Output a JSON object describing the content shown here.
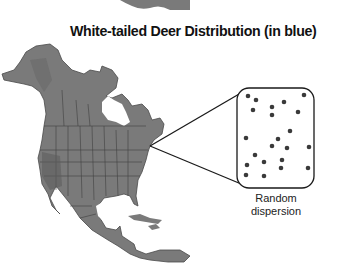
{
  "title": "White-tailed Deer Distribution (in blue)",
  "inset": {
    "label_line1": "Random",
    "label_line2": "dispersion",
    "dots": [
      [
        248,
        96
      ],
      [
        256,
        100
      ],
      [
        253,
        110
      ],
      [
        272,
        107
      ],
      [
        272,
        115
      ],
      [
        284,
        102
      ],
      [
        304,
        95
      ],
      [
        298,
        112
      ],
      [
        290,
        131
      ],
      [
        246,
        138
      ],
      [
        278,
        139
      ],
      [
        272,
        146
      ],
      [
        287,
        148
      ],
      [
        309,
        147
      ],
      [
        255,
        155
      ],
      [
        264,
        162
      ],
      [
        282,
        160
      ],
      [
        247,
        165
      ],
      [
        281,
        168
      ],
      [
        308,
        168
      ],
      [
        246,
        175
      ],
      [
        264,
        176
      ]
    ]
  },
  "colors": {
    "map_fill": "#7a7a7a",
    "map_border": "#3f3f3f",
    "dot": "#3a3a3a",
    "line": "#1a1a1a"
  }
}
